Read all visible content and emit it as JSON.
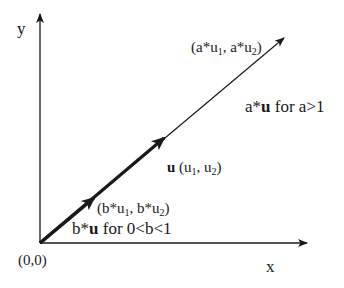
{
  "diagram": {
    "axes": {
      "x_label": "x",
      "y_label": "y",
      "origin_label": "(0,0)"
    },
    "vectors": {
      "a_point": {
        "open": "(a*u",
        "sub1": "1",
        "mid": ", a*u",
        "sub2": "2",
        "close": ")"
      },
      "a_caption": {
        "pre": "a*",
        "bold": "u",
        "post": " for a>1"
      },
      "u_label": {
        "bold": "u",
        "open": " (u",
        "sub1": "1",
        "mid": ", u",
        "sub2": "2",
        "close": ")"
      },
      "b_point": {
        "open": "(b*u",
        "sub1": "1",
        "mid": ", b*u",
        "sub2": "2",
        "close": ")"
      },
      "b_caption": {
        "pre": "b*",
        "bold": "u",
        "post": " for 0<b<1"
      }
    },
    "colors": {
      "line": "#1a1a1a",
      "background": "#ffffff"
    }
  }
}
